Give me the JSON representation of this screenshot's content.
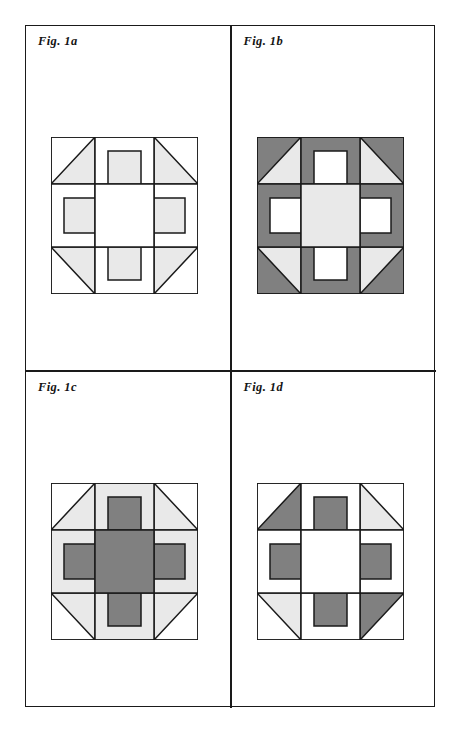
{
  "page": {
    "background_color": "#ffffff",
    "frame_border_color": "#1a1a1a",
    "width": 454,
    "height": 730
  },
  "palette": {
    "white": "#ffffff",
    "light_gray": "#e9e9e9",
    "dark_gray": "#808080",
    "outline": "#1a1a1a"
  },
  "figures": [
    {
      "id": "fig-1a",
      "label": "Fig. 1a",
      "description": "Quilt block: white background with light gray triangles, sashing and pinwheel arms",
      "block": {
        "corners": {
          "tl": {
            "square": "white",
            "triangle": "light_gray",
            "triangle_orientation": "lower-left"
          },
          "tr": {
            "square": "white",
            "triangle": "light_gray",
            "triangle_orientation": "lower-right"
          },
          "bl": {
            "square": "white",
            "triangle": "light_gray",
            "triangle_orientation": "upper-left"
          },
          "br": {
            "square": "white",
            "triangle": "light_gray",
            "triangle_orientation": "upper-right"
          }
        },
        "edges": {
          "top": {
            "outer": "white",
            "inner": "light_gray"
          },
          "bottom": {
            "outer": "white",
            "inner": "light_gray"
          },
          "left": {
            "outer": "white",
            "inner": "light_gray"
          },
          "right": {
            "outer": "white",
            "inner": "light_gray"
          }
        },
        "center": "white"
      }
    },
    {
      "id": "fig-1b",
      "label": "Fig. 1b",
      "description": "Quilt block: dark gray background with light gray triangles and light gray center",
      "block": {
        "corners": {
          "tl": {
            "square": "dark_gray",
            "triangle": "light_gray",
            "triangle_orientation": "lower-left"
          },
          "tr": {
            "square": "dark_gray",
            "triangle": "light_gray",
            "triangle_orientation": "lower-right"
          },
          "bl": {
            "square": "dark_gray",
            "triangle": "light_gray",
            "triangle_orientation": "upper-left"
          },
          "br": {
            "square": "dark_gray",
            "triangle": "light_gray",
            "triangle_orientation": "upper-right"
          }
        },
        "edges": {
          "top": {
            "outer": "dark_gray",
            "inner": "white"
          },
          "bottom": {
            "outer": "dark_gray",
            "inner": "white"
          },
          "left": {
            "outer": "dark_gray",
            "inner": "white"
          },
          "right": {
            "outer": "dark_gray",
            "inner": "white"
          }
        },
        "center": "light_gray"
      }
    },
    {
      "id": "fig-1c",
      "label": "Fig. 1c",
      "description": "Quilt block: white corners with light gray triangles, dark gray cross and center",
      "block": {
        "corners": {
          "tl": {
            "square": "white",
            "triangle": "light_gray",
            "triangle_orientation": "lower-left"
          },
          "tr": {
            "square": "white",
            "triangle": "light_gray",
            "triangle_orientation": "lower-right"
          },
          "bl": {
            "square": "white",
            "triangle": "light_gray",
            "triangle_orientation": "upper-left"
          },
          "br": {
            "square": "white",
            "triangle": "light_gray",
            "triangle_orientation": "upper-right"
          }
        },
        "edges": {
          "top": {
            "outer": "light_gray",
            "inner": "dark_gray"
          },
          "bottom": {
            "outer": "light_gray",
            "inner": "dark_gray"
          },
          "left": {
            "outer": "light_gray",
            "inner": "dark_gray"
          },
          "right": {
            "outer": "light_gray",
            "inner": "dark_gray"
          }
        },
        "center": "dark_gray"
      }
    },
    {
      "id": "fig-1d",
      "label": "Fig. 1d",
      "description": "Quilt block: pinwheel with dark gray arms, white background, one light gray triangle",
      "block": {
        "corners": {
          "tl": {
            "square": "white",
            "triangle": "dark_gray",
            "triangle_orientation": "lower-left"
          },
          "tr": {
            "square": "white",
            "triangle": "light_gray",
            "triangle_orientation": "lower-right"
          },
          "bl": {
            "square": "white",
            "triangle": "light_gray",
            "triangle_orientation": "upper-left"
          },
          "br": {
            "square": "white",
            "triangle": "dark_gray",
            "triangle_orientation": "upper-right"
          }
        },
        "edges": {
          "top": {
            "outer": "white",
            "inner": "dark_gray"
          },
          "bottom": {
            "outer": "white",
            "inner": "dark_gray"
          },
          "left": {
            "outer": "white",
            "inner": "dark_gray"
          },
          "right": {
            "outer": "white",
            "inner": "dark_gray"
          }
        },
        "center": "white"
      }
    }
  ]
}
